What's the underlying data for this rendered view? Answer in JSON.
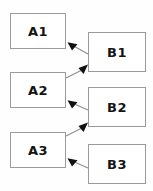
{
  "diagram": {
    "title": "",
    "background_color": "#fefefe",
    "node_border_color": "#9b9b9b",
    "node_fill_color": "#ffffff",
    "label_color": "#141414",
    "edge_line_color": "#8f8f8f",
    "arrowhead_color": "#111111",
    "left_column": [
      {
        "id": "a1",
        "label": "A1"
      },
      {
        "id": "a2",
        "label": "A2"
      },
      {
        "id": "a3",
        "label": "A3"
      }
    ],
    "right_column": [
      {
        "id": "b1",
        "label": "B1"
      },
      {
        "id": "b2",
        "label": "B2"
      },
      {
        "id": "b3",
        "label": "B3"
      }
    ],
    "edges": [
      {
        "id": "e1",
        "from": "b1",
        "to": "a1",
        "direction": "up-left"
      },
      {
        "id": "e2",
        "from": "a2",
        "to": "b1",
        "direction": "up-right"
      },
      {
        "id": "e3",
        "from": "b2",
        "to": "a2",
        "direction": "up-left"
      },
      {
        "id": "e4",
        "from": "a3",
        "to": "b2",
        "direction": "up-right"
      },
      {
        "id": "e5",
        "from": "b3",
        "to": "a3",
        "direction": "up-left"
      }
    ]
  }
}
